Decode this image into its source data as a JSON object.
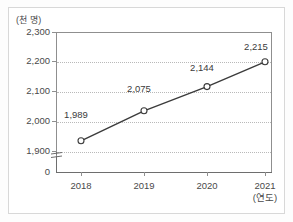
{
  "chart_data": {
    "type": "line",
    "title": "",
    "subtitle": "",
    "xlabel": "(연도)",
    "ylabel": "(천 명)",
    "categories": [
      "2018",
      "2019",
      "2020",
      "2021"
    ],
    "values": [
      1989,
      2075,
      2144,
      2215
    ],
    "point_labels": [
      "1,989",
      "2,075",
      "2,144",
      "2,215"
    ],
    "ylim": [
      1900,
      2300
    ],
    "yticks": [
      2300,
      2200,
      2100,
      2000,
      1900
    ],
    "ytick_labels": [
      "2,300",
      "2,200",
      "2,100",
      "2,000",
      "1,900"
    ],
    "axis_break": true,
    "axis_origin_label": "0",
    "grid": "horizontal-dotted",
    "legend": "none",
    "series": [
      {
        "name": "인구",
        "values": [
          1989,
          2075,
          2144,
          2215
        ],
        "marker": "open-circle",
        "line_color": "#3b3b3b",
        "marker_fill": "#ffffff"
      }
    ]
  },
  "axes": {
    "y_unit_label": "(천 명)",
    "x_unit_label": "(연도)",
    "origin_label": "0",
    "y_tick_labels": [
      "2,300",
      "2,200",
      "2,100",
      "2,000",
      "1,900"
    ],
    "x_tick_labels": [
      "2018",
      "2019",
      "2020",
      "2021"
    ]
  },
  "labels": {
    "p0": "1,989",
    "p1": "2,075",
    "p2": "2,144",
    "p3": "2,215"
  },
  "colors": {
    "line": "#3b3b3b",
    "marker_fill": "#ffffff",
    "grid": "#b9b9b9",
    "axis": "#8f8f8f",
    "frame": "#d8d8d8",
    "text": "#4a4a4a",
    "background": "#ffffff"
  }
}
